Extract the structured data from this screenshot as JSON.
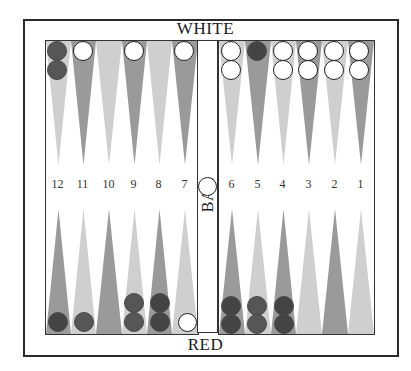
{
  "board": {
    "top_label": "WHITE",
    "bottom_label": "RED",
    "bar_label": "BAR",
    "colors": {
      "dark_point": "#9a9a9a",
      "light_point": "#cfcfcf",
      "red_checker": "#565656",
      "red_checker_dark": "#444444",
      "white_checker": "#ffffff",
      "border": "#2a2a2a"
    },
    "point_numbers_left": [
      "12",
      "11",
      "10",
      "9",
      "8",
      "7"
    ],
    "point_numbers_right": [
      "6",
      "5",
      "4",
      "3",
      "2",
      "1"
    ],
    "top_points": [
      {
        "point": 12,
        "shade": "light",
        "checkers": [
          "red",
          "red"
        ]
      },
      {
        "point": 11,
        "shade": "dark",
        "checkers": [
          "white"
        ]
      },
      {
        "point": 10,
        "shade": "light",
        "checkers": []
      },
      {
        "point": 9,
        "shade": "dark",
        "checkers": [
          "white"
        ]
      },
      {
        "point": 8,
        "shade": "light",
        "checkers": []
      },
      {
        "point": 7,
        "shade": "dark",
        "checkers": [
          "white"
        ]
      },
      {
        "point": 6,
        "shade": "light",
        "checkers": [
          "white",
          "white"
        ]
      },
      {
        "point": 5,
        "shade": "dark",
        "checkers": [
          "red"
        ]
      },
      {
        "point": 4,
        "shade": "light",
        "checkers": [
          "white",
          "white"
        ]
      },
      {
        "point": 3,
        "shade": "dark",
        "checkers": [
          "white",
          "white"
        ]
      },
      {
        "point": 2,
        "shade": "light",
        "checkers": [
          "white",
          "white"
        ]
      },
      {
        "point": 1,
        "shade": "dark",
        "checkers": [
          "white",
          "white"
        ]
      }
    ],
    "bottom_points": [
      {
        "point": 12,
        "shade": "dark",
        "checkers": [
          "red"
        ]
      },
      {
        "point": 11,
        "shade": "light",
        "checkers": [
          "red"
        ]
      },
      {
        "point": 10,
        "shade": "dark",
        "checkers": []
      },
      {
        "point": 9,
        "shade": "light",
        "checkers": [
          "red",
          "red"
        ]
      },
      {
        "point": 8,
        "shade": "dark",
        "checkers": [
          "red",
          "red"
        ]
      },
      {
        "point": 7,
        "shade": "light",
        "checkers": [
          "white"
        ]
      },
      {
        "point": 6,
        "shade": "dark",
        "checkers": [
          "red",
          "red"
        ]
      },
      {
        "point": 5,
        "shade": "light",
        "checkers": [
          "red",
          "red"
        ]
      },
      {
        "point": 4,
        "shade": "dark",
        "checkers": [
          "red",
          "red"
        ]
      },
      {
        "point": 3,
        "shade": "light",
        "checkers": []
      },
      {
        "point": 2,
        "shade": "dark",
        "checkers": []
      },
      {
        "point": 1,
        "shade": "light",
        "checkers": []
      }
    ],
    "bar_checkers": [
      "white"
    ]
  }
}
